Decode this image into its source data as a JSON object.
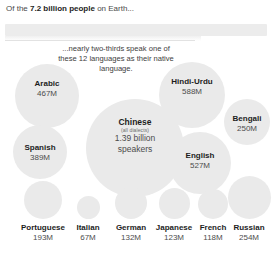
{
  "headline": {
    "prefix": "Of the ",
    "emphasis": "7.2 billion people",
    "suffix": " on Earth..."
  },
  "callout": {
    "text": "...nearly two-thirds speak one of these 12 languages as their native language."
  },
  "colors": {
    "bubble": "#eaeaea",
    "band": "#ececec",
    "name_text": "#1d1d1d",
    "value_text": "#4d4d4d",
    "body_text": "#3d3d3d",
    "background": "#ffffff"
  },
  "chart_data": {
    "type": "bubble",
    "title": "Of the 7.2 billion people on Earth...",
    "subtitle": "...nearly two-thirds speak one of these 12 languages as their native language.",
    "unit": "millions of native speakers",
    "world_population": "7.2 billion",
    "language_count": 12,
    "categories": [
      "Chinese",
      "Hindi-Urdu",
      "English",
      "Arabic",
      "Spanish",
      "Russian",
      "Bengali",
      "Portuguese",
      "German",
      "Japanese",
      "French",
      "Italian"
    ],
    "values": [
      1390,
      588,
      527,
      467,
      389,
      254,
      250,
      193,
      132,
      123,
      118,
      67
    ],
    "labels": [
      "1.39 billion speakers",
      "588M",
      "527M",
      "467M",
      "389M",
      "254M",
      "250M",
      "193M",
      "132M",
      "123M",
      "118M",
      "67M"
    ],
    "xlabel": "",
    "ylabel": "",
    "grid": false,
    "legend": false
  },
  "cluster": [
    {
      "name": "Arabic",
      "sub": "",
      "value": "467M",
      "diameter": 64
    },
    {
      "name": "Chinese",
      "sub": "(all dialects)",
      "value": "1.39 billion\nspeakers",
      "diameter": 98
    },
    {
      "name": "Hindi-Urdu",
      "sub": "",
      "value": "588M",
      "diameter": 66
    },
    {
      "name": "Bengali",
      "sub": "",
      "value": "250M",
      "diameter": 46
    },
    {
      "name": "Spanish",
      "sub": "",
      "value": "389M",
      "diameter": 54
    },
    {
      "name": "English",
      "sub": "",
      "value": "527M",
      "diameter": 62
    }
  ],
  "bottom_row": [
    {
      "name": "Portuguese",
      "value": "193M",
      "diameter": 38
    },
    {
      "name": "Italian",
      "value": "67M",
      "diameter": 23
    },
    {
      "name": "German",
      "value": "132M",
      "diameter": 32
    },
    {
      "name": "Japanese",
      "value": "123M",
      "diameter": 31
    },
    {
      "name": "French",
      "value": "118M",
      "diameter": 30
    },
    {
      "name": "Russian",
      "value": "254M",
      "diameter": 43
    }
  ]
}
